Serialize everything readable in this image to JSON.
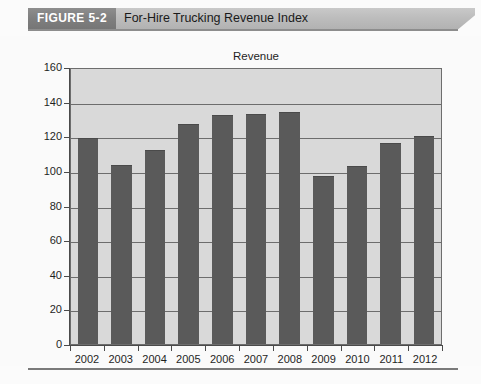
{
  "figure": {
    "tag": "FIGURE 5-2",
    "title": "For-Hire Trucking Revenue Index"
  },
  "colors": {
    "tag_background": "#7f7f7f",
    "band_background": "#bdbdbd",
    "plot_background": "#d9d9d9",
    "bar_fill": "#5a5a5a",
    "axis": "#4a4a4a",
    "gridline": "#6d6d6d",
    "text": "#1f1f1f"
  },
  "chart_data": {
    "type": "bar",
    "title": "Revenue",
    "xlabel": "",
    "ylabel": "",
    "categories": [
      "2002",
      "2003",
      "2004",
      "2005",
      "2006",
      "2007",
      "2008",
      "2009",
      "2010",
      "2011",
      "2012"
    ],
    "values": [
      119,
      103.5,
      112,
      127,
      132,
      133,
      134,
      97,
      103,
      116,
      120
    ],
    "ylim": [
      0,
      160
    ],
    "yticks": [
      0,
      20,
      40,
      60,
      80,
      100,
      120,
      140,
      160
    ],
    "ytick_labels": [
      "0",
      "20",
      "40",
      "60",
      "80",
      "100",
      "120",
      "140",
      "160"
    ],
    "grid": true,
    "grid_axis": "y",
    "legend": false,
    "series": [
      {
        "name": "Revenue",
        "values": [
          119,
          103.5,
          112,
          127,
          132,
          133,
          134,
          97,
          103,
          116,
          120
        ]
      }
    ]
  }
}
